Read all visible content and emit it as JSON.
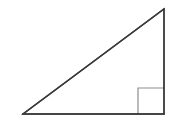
{
  "figure": {
    "background_color": "#ffffff",
    "width": 172,
    "height": 132,
    "stroke_color": "#3a3a3a",
    "stroke_width": 1.4,
    "marker_color": "#8e8e8e",
    "marker_stroke_width": 1.2,
    "watermark_text": "",
    "watermark_color": "#fafafa",
    "shape": {
      "type": "right-triangle",
      "vertices": [
        {
          "name": "bottom-left",
          "x": 23,
          "y": 114
        },
        {
          "name": "bottom-right",
          "x": 164,
          "y": 114
        },
        {
          "name": "top-right",
          "x": 164,
          "y": 9
        }
      ],
      "right_angle_at": "bottom-right",
      "right_angle_marker": {
        "size": 26,
        "x": 138,
        "y": 88
      },
      "edges": [
        {
          "name": "base",
          "from": "bottom-left",
          "to": "bottom-right"
        },
        {
          "name": "vertical-leg",
          "from": "bottom-right",
          "to": "top-right"
        },
        {
          "name": "hypotenuse",
          "from": "top-right",
          "to": "bottom-left"
        }
      ]
    }
  }
}
